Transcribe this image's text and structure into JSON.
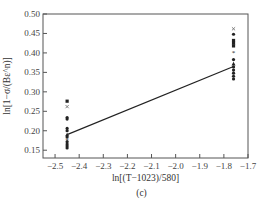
{
  "chart_data": {
    "type": "scatter",
    "panel_label": "(c)",
    "title": "",
    "xlabel": "ln[(T−1023)/580]",
    "ylabel": "ln[1−σ/(Bε^n)]",
    "xlim": [
      -2.55,
      -1.7
    ],
    "ylim": [
      0.13,
      0.5
    ],
    "x_ticks": [
      "−2.5",
      "−2.4",
      "−2.3",
      "−2.2",
      "−2.1",
      "−2.0",
      "−1.9",
      "−1.8",
      "−1.7"
    ],
    "y_ticks": [
      "0.50",
      "0.45",
      "0.40",
      "0.35",
      "0.30",
      "0.25",
      "0.20",
      "0.15"
    ],
    "grid": false,
    "series": [
      {
        "name": "data (x = -2.45)",
        "x": -2.45,
        "points": [
          {
            "y": 0.276,
            "marker": "square"
          },
          {
            "y": 0.262,
            "marker": "x"
          },
          {
            "y": 0.234,
            "marker": "circle"
          },
          {
            "y": 0.23,
            "marker": "circle"
          },
          {
            "y": 0.206,
            "marker": "circle"
          },
          {
            "y": 0.2,
            "marker": "circle"
          },
          {
            "y": 0.19,
            "marker": "triangle"
          },
          {
            "y": 0.184,
            "marker": "circle"
          },
          {
            "y": 0.178,
            "marker": "star"
          },
          {
            "y": 0.172,
            "marker": "circle"
          },
          {
            "y": 0.166,
            "marker": "circle"
          },
          {
            "y": 0.161,
            "marker": "circle"
          },
          {
            "y": 0.156,
            "marker": "circle"
          }
        ]
      },
      {
        "name": "data (x = -1.76)",
        "x": -1.76,
        "points": [
          {
            "y": 0.462,
            "marker": "x"
          },
          {
            "y": 0.448,
            "marker": "circle"
          },
          {
            "y": 0.432,
            "marker": "square"
          },
          {
            "y": 0.425,
            "marker": "square"
          },
          {
            "y": 0.418,
            "marker": "square"
          },
          {
            "y": 0.4,
            "marker": "star"
          },
          {
            "y": 0.383,
            "marker": "circle"
          },
          {
            "y": 0.372,
            "marker": "triangle"
          },
          {
            "y": 0.364,
            "marker": "circle"
          },
          {
            "y": 0.356,
            "marker": "circle"
          },
          {
            "y": 0.348,
            "marker": "circle"
          },
          {
            "y": 0.34,
            "marker": "circle"
          },
          {
            "y": 0.333,
            "marker": "circle"
          }
        ]
      }
    ],
    "fit_line": {
      "x": [
        -2.45,
        -1.76
      ],
      "y": [
        0.19,
        0.365
      ]
    }
  }
}
